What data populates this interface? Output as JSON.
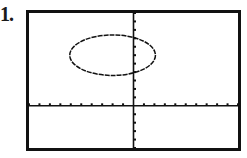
{
  "problem": {
    "number_label": "1."
  },
  "colors": {
    "background": "#ffffff",
    "ink": "#111111"
  },
  "chart_data": {
    "type": "line",
    "title": "",
    "xlabel": "",
    "ylabel": "",
    "xlim": [
      -10,
      10
    ],
    "ylim": [
      -5,
      11
    ],
    "x_ticks_step": 1,
    "y_ticks_step": 1,
    "grid": false,
    "legend": null,
    "series": [
      {
        "name": "ellipse",
        "kind": "ellipse",
        "center": [
          -2,
          6
        ],
        "semi_axis_x": 4.1,
        "semi_axis_y": 2.4,
        "approx_equation": "(x+2)^2/16 + (y-6)^2/6 = 1"
      }
    ]
  }
}
